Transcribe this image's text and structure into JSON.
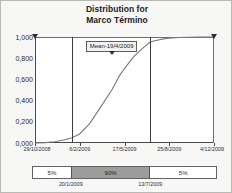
{
  "title": {
    "line1": "Distribution for",
    "line2": "Marco Término"
  },
  "mean_callout": {
    "label": "Mean-19/4/2009"
  },
  "percentile_bar": {
    "segments": [
      {
        "label": "5%",
        "shade": "light"
      },
      {
        "label": "90%",
        "shade": "dark"
      },
      {
        "label": "5%",
        "shade": "light"
      }
    ],
    "boundary_dates": [
      "20/1/2009",
      "13/7/2009"
    ]
  },
  "chart_data": {
    "type": "line",
    "title": "Distribution for Marco Término",
    "subtitle": "",
    "xlabel": "",
    "ylabel": "",
    "grid": false,
    "legend_position": "none",
    "ylim": [
      0,
      1
    ],
    "ytick_labels": [
      "1,000",
      "0,800",
      "0,600",
      "0,400",
      "0,200",
      "0,000"
    ],
    "ytick_values": [
      1.0,
      0.8,
      0.6,
      0.4,
      0.2,
      0.0
    ],
    "xtick_labels": [
      "29/10/2008",
      "6/2/2009",
      "17/5/2009",
      "25/8/2009",
      "4/12/2009"
    ],
    "series": [
      {
        "name": "Cumulative probability",
        "x": [
          "29/10/2008",
          "20/11/2008",
          "12/12/2008",
          "3/1/2009",
          "20/1/2009",
          "6/2/2009",
          "28/2/2009",
          "22/3/2009",
          "19/4/2009",
          "7/5/2009",
          "17/5/2009",
          "8/6/2009",
          "30/6/2009",
          "13/7/2009",
          "22/7/2009",
          "13/8/2009",
          "25/8/2009",
          "16/9/2009",
          "8/10/2009",
          "30/10/2009",
          "4/12/2009"
        ],
        "values": [
          0.0,
          0.004,
          0.012,
          0.03,
          0.05,
          0.085,
          0.18,
          0.32,
          0.5,
          0.64,
          0.7,
          0.82,
          0.905,
          0.95,
          0.962,
          0.982,
          0.988,
          0.995,
          0.998,
          0.999,
          1.0
        ]
      }
    ],
    "annotations": [
      {
        "type": "vertical-line",
        "x": "20/1/2009",
        "percentile": 5
      },
      {
        "type": "vertical-line",
        "x": "13/7/2009",
        "percentile": 95
      },
      {
        "type": "callout",
        "x": "19/4/2009",
        "text": "Mean-19/4/2009"
      },
      {
        "type": "marker",
        "x": "29/10/2008",
        "shape": "triangle-down"
      },
      {
        "type": "marker",
        "x": "4/12/2009",
        "shape": "triangle-down"
      }
    ]
  }
}
